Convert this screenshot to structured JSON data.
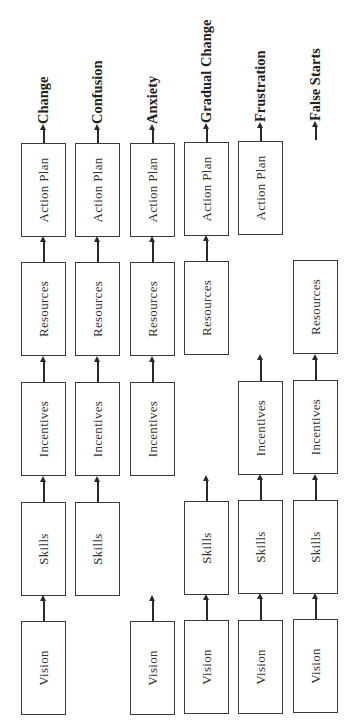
{
  "diagram": {
    "title": "",
    "stage_labels": {
      "vision": "Vision",
      "skills": "Skills",
      "incentives": "Incentives",
      "resources": "Resources",
      "action_plan": "Action Plan"
    },
    "columns": [
      {
        "outcome": "Change",
        "has": [
          "Vision",
          "Skills",
          "Incentives",
          "Resources",
          "Action Plan"
        ]
      },
      {
        "outcome": "Confusion",
        "has": [
          "Skills",
          "Incentives",
          "Resources",
          "Action Plan"
        ],
        "missing": "Vision"
      },
      {
        "outcome": "Anxiety",
        "has": [
          "Vision",
          "Incentives",
          "Resources",
          "Action Plan"
        ],
        "missing": "Skills"
      },
      {
        "outcome": "Gradual Change",
        "has": [
          "Vision",
          "Skills",
          "Resources",
          "Action Plan"
        ],
        "missing": "Incentives"
      },
      {
        "outcome": "Frustration",
        "has": [
          "Vision",
          "Skills",
          "Incentives",
          "Action Plan"
        ],
        "missing": "Resources"
      },
      {
        "outcome": "False Starts",
        "has": [
          "Vision",
          "Skills",
          "Incentives",
          "Resources"
        ],
        "missing": "Action Plan"
      }
    ]
  },
  "outcomes": {
    "c1": "Change",
    "c2": "Confusion",
    "c3": "Anxiety",
    "c4": "Gradual Change",
    "c5": "Frustration",
    "c6": "False Starts"
  },
  "colors": {
    "line": "#2a2a2a",
    "background": "#ffffff"
  }
}
